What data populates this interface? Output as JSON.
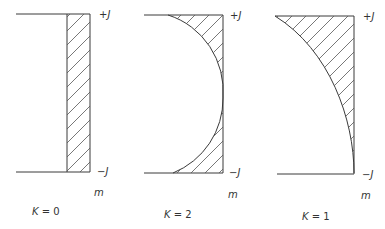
{
  "diagram": {
    "panels": [
      {
        "name": "panel-k0",
        "caption_k": "K",
        "caption_eq": " = 0",
        "top_label": "+J",
        "bottom_label": "−J",
        "axis_label": "m",
        "shape": "rectangle-strip"
      },
      {
        "name": "panel-k2",
        "caption_k": "K",
        "caption_eq": " = 2",
        "top_label": "+J",
        "bottom_label": "−J",
        "axis_label": "m",
        "shape": "semicircle-complement"
      },
      {
        "name": "panel-k1",
        "caption_k": "K",
        "caption_eq": " = 1",
        "top_label": "+J",
        "bottom_label": "−J",
        "axis_label": "m",
        "shape": "quarter-ellipse-complement"
      }
    ],
    "colors": {
      "line": "#3a3a3a",
      "hatch": "#555555",
      "text": "#333333",
      "background": "#ffffff"
    }
  }
}
